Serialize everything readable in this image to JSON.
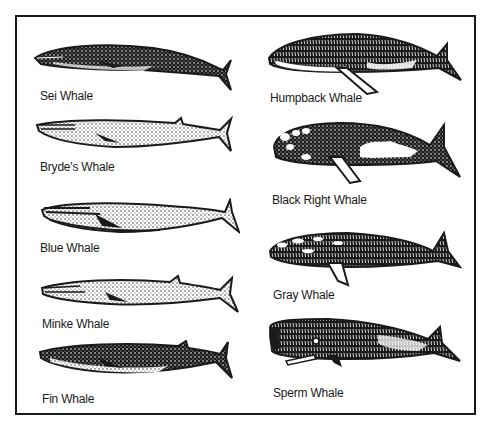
{
  "figure": {
    "title": "",
    "left_column": [
      {
        "name": "Sei Whale",
        "style": "dark-stippled"
      },
      {
        "name": "Bryde's Whale",
        "style": "light-stippled"
      },
      {
        "name": "Blue Whale",
        "style": "light-stippled"
      },
      {
        "name": "Minke Whale",
        "style": "light-stippled"
      },
      {
        "name": "Fin Whale",
        "style": "dark-stippled"
      }
    ],
    "right_column": [
      {
        "name": "Humpback Whale",
        "style": "dark-with-long-flipper"
      },
      {
        "name": "Black Right Whale",
        "style": "dark-with-white-patches"
      },
      {
        "name": "Gray Whale",
        "style": "mottled"
      },
      {
        "name": "Sperm Whale",
        "style": "dark-blunt-head"
      }
    ]
  },
  "colors": {
    "ink": "#1a1a1a",
    "paper": "#ffffff"
  }
}
